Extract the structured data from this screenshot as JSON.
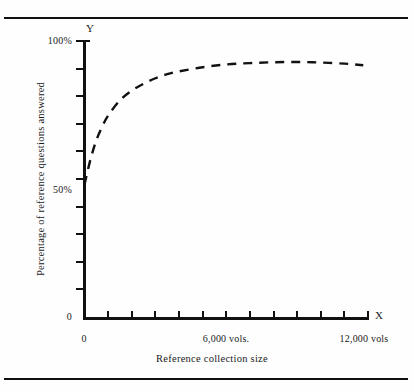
{
  "figure": {
    "axis_letter_y": "Y",
    "axis_letter_x": "X",
    "title_x": "Reference collection size",
    "title_y": "Percentage of reference questions answered"
  },
  "chart_data": {
    "type": "line",
    "title": "",
    "subtitle": "",
    "xlabel": "Reference collection size",
    "ylabel": "Percentage of reference questions answered",
    "axis_letter_x": "X",
    "axis_letter_y": "Y",
    "grid": false,
    "legend": null,
    "line_style": "dashed",
    "line_color": "#111111",
    "xlim": [
      0,
      12000
    ],
    "ylim": [
      0,
      100
    ],
    "x_tick_labels": [
      "0",
      "6,000 vols.",
      "12,000 vols"
    ],
    "x_tick_values": [
      0,
      6000,
      12000
    ],
    "x_minor_tick_values": [
      1000,
      2000,
      3000,
      4000,
      5000,
      6000,
      7000,
      8000,
      9000,
      10000,
      11000
    ],
    "y_tick_labels": [
      "0",
      "50%",
      "100%"
    ],
    "y_tick_values": [
      0,
      50,
      100
    ],
    "y_minor_tick_values": [
      10,
      20,
      30,
      40,
      50,
      60,
      70,
      80,
      90,
      100
    ],
    "series": [
      {
        "name": "Percentage of reference questions answered",
        "x": [
          0,
          250,
          500,
          750,
          1000,
          1500,
          2000,
          2500,
          3000,
          3500,
          4000,
          5000,
          6000,
          7000,
          8000,
          9000,
          10000,
          11000,
          11800
        ],
        "values": [
          48,
          57,
          64,
          69,
          73,
          78.5,
          82,
          84.5,
          86.5,
          88,
          89,
          90.5,
          91.5,
          92,
          92.3,
          92.4,
          92.2,
          91.8,
          91.2
        ]
      }
    ]
  }
}
